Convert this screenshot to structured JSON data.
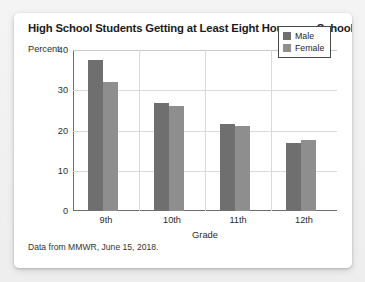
{
  "chart_data": {
    "type": "bar",
    "title": "High School Students Getting at Least Eight Hours per School Night",
    "xlabel": "Grade",
    "ylabel": "Percent",
    "categories": [
      "9th",
      "10th",
      "11th",
      "12th"
    ],
    "series": [
      {
        "name": "Male",
        "color": "#6f6f6f",
        "values": [
          37.5,
          26.8,
          21.6,
          17.0
        ]
      },
      {
        "name": "Female",
        "color": "#8e8e8e",
        "values": [
          32.0,
          26.0,
          21.0,
          17.6
        ]
      }
    ],
    "ylim": [
      0,
      40
    ],
    "yticks": [
      0,
      10,
      20,
      30,
      40
    ],
    "grid": true,
    "legend_position": "top-right",
    "annotation": "Data from MMWR, June 15, 2018."
  },
  "legend": {
    "items": [
      {
        "label": "Male"
      },
      {
        "label": "Female"
      }
    ]
  }
}
